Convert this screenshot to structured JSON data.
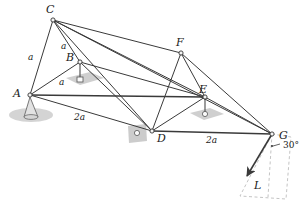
{
  "figure": {
    "kind": "space-truss-free-body-diagram",
    "background_color": "#ffffff",
    "member_color": "#3a3a3a",
    "support_pad_color": "#c9c9c9",
    "dashed_plane_color": "#bdbdbd",
    "node_fill": "#f2f2f2"
  },
  "nodes": [
    {
      "id": "A",
      "label": "A",
      "x": 30,
      "y": 95,
      "label_x": 13,
      "label_y": 88,
      "support": "cone-ball-socket"
    },
    {
      "id": "B",
      "label": "B",
      "x": 80,
      "y": 62,
      "label_x": 66,
      "label_y": 52,
      "support": "pin-on-pad"
    },
    {
      "id": "C",
      "label": "C",
      "x": 53,
      "y": 20,
      "label_x": 46,
      "label_y": 4,
      "support": "none"
    },
    {
      "id": "D",
      "label": "D",
      "x": 152,
      "y": 131,
      "label_x": 157,
      "label_y": 133,
      "support": "ball-on-pad"
    },
    {
      "id": "E",
      "label": "E",
      "x": 205,
      "y": 97,
      "label_x": 199,
      "label_y": 84,
      "support": "pin-on-pad"
    },
    {
      "id": "F",
      "label": "F",
      "x": 181,
      "y": 53,
      "label_x": 176,
      "label_y": 37,
      "support": "none"
    },
    {
      "id": "G",
      "label": "G",
      "x": 272,
      "y": 134,
      "label_x": 279,
      "label_y": 130,
      "support": "none"
    }
  ],
  "members": [
    {
      "from": "A",
      "to": "C"
    },
    {
      "from": "A",
      "to": "B"
    },
    {
      "from": "A",
      "to": "D"
    },
    {
      "from": "A",
      "to": "E"
    },
    {
      "from": "B",
      "to": "C"
    },
    {
      "from": "B",
      "to": "D"
    },
    {
      "from": "B",
      "to": "E"
    },
    {
      "from": "C",
      "to": "D"
    },
    {
      "from": "C",
      "to": "E"
    },
    {
      "from": "C",
      "to": "F"
    },
    {
      "from": "C",
      "to": "G"
    },
    {
      "from": "D",
      "to": "E"
    },
    {
      "from": "D",
      "to": "F"
    },
    {
      "from": "D",
      "to": "G"
    },
    {
      "from": "E",
      "to": "F"
    },
    {
      "from": "E",
      "to": "G"
    },
    {
      "from": "F",
      "to": "G"
    }
  ],
  "dimensions": [
    {
      "id": "a-AC",
      "text": "a",
      "x": 28,
      "y": 53
    },
    {
      "id": "a-CB",
      "text": "a",
      "x": 61,
      "y": 42
    },
    {
      "id": "a-AB",
      "text": "a",
      "x": 59,
      "y": 78
    },
    {
      "id": "2a-AD",
      "text": "2a",
      "x": 74,
      "y": 113
    },
    {
      "id": "2a-DG",
      "text": "2a",
      "x": 206,
      "y": 136
    }
  ],
  "load": {
    "label": "L",
    "label_x": 254,
    "label_y": 180,
    "start_x": 272,
    "start_y": 134,
    "end_x": 247,
    "end_y": 176,
    "angle_label": "30°",
    "angle_label_x": 283,
    "angle_label_y": 146,
    "angle_value": 30,
    "angle_units": "degrees",
    "reference": "vertical dashed line at G"
  },
  "load_plane": {
    "description": "dashed parallelogram showing plane of the applied load at G",
    "points": "272,134 291,137 286,199 240,196"
  }
}
